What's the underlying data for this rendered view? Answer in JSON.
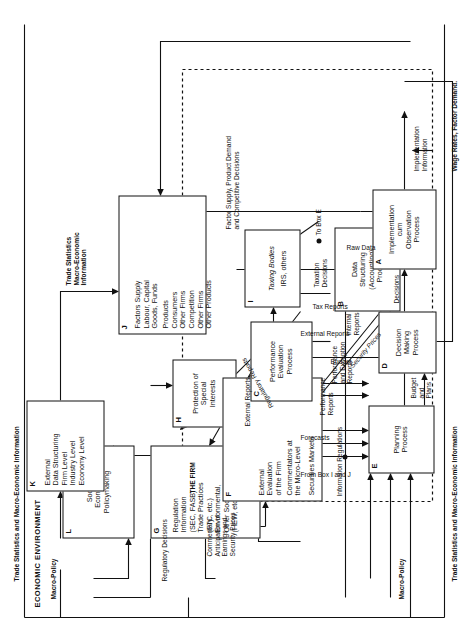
{
  "figure": {
    "title": "ECONOMIC ENVIRONMENT",
    "inner_region_label": "THE FIRM"
  },
  "boxes": [
    {
      "id": "A",
      "tag": "A",
      "text": "Implementation\ncum\nObservation\nProcess"
    },
    {
      "id": "B",
      "tag": "B",
      "text": "Data\nStructuring\n(Accounting)\nProcess"
    },
    {
      "id": "C",
      "tag": "C",
      "text": "Performance\nEvaluation\nProcess"
    },
    {
      "id": "D",
      "tag": "D",
      "text": "Decision\nMaking\nProcess"
    },
    {
      "id": "E",
      "tag": "E",
      "text": "Planning\nProcess"
    },
    {
      "id": "F",
      "tag": "F",
      "text": "External\nEvaluation\nof the Firm",
      "text2": "Commentators at\nthe Micro-Level",
      "text3": "Securities Markets"
    },
    {
      "id": "G",
      "tag": "G",
      "text": "Regulation\nInformation\n(SEC, FASB)\nTrade Practices\n(FTC, etc.)\nEnvironmental,\nOther Social\n(HEW, etc.)"
    },
    {
      "id": "H",
      "tag": "H",
      "text": "Protection of\nSpecial\nInterests"
    },
    {
      "id": "I",
      "tag": "I",
      "text_italic": "Taxing Bodies",
      "text": "IRS, others"
    },
    {
      "id": "J",
      "tag": "J",
      "group1_title": "Factors Supply",
      "group1": "Labour, Capital\nGoods, Funds",
      "group2_title": "Products",
      "group2": "Consumers\nOther Firms",
      "group3_title": "Competition",
      "group3": "Other Firms\nOther Products"
    },
    {
      "id": "K",
      "tag": "K",
      "text": "External\nData Structuring\nFirm Level\nIndustry Level\nEconomy Level"
    },
    {
      "id": "L",
      "tag": "L",
      "text": "Socio-\nEconomic\nPolicymaking"
    }
  ],
  "flow_labels": {
    "trade_stats_top": "Trade Statistics and Macro-Economic Information",
    "trade_stats_bottom": "Trade Statistics and Macro-Economic Information",
    "trade_stats_k_to_j": "Trade Statistics\nMacro-Economic\nInformation",
    "macro_policy_1": "Macro-Policy",
    "macro_policy_2": "Macro-Policy",
    "regulatory_decisions": "Regulatory Decisions",
    "regulatory_reports": "Regulatory Reports",
    "commentary": "Commentary\nAnticipation of\nEarnings and\nSecurity Prices",
    "information_regulations": "Information Regulations",
    "security_prices": "Security Prices",
    "external_reports_main": "External Reports",
    "external_reports_inner": "External Reports",
    "internal_reports": "Internal\nReports",
    "tax_reports": "Tax Reports",
    "taxation_decisions": "Taxation\nDecisions",
    "to_box_e": "To Box E",
    "factor_supply_demand": "Factor Supply, Product Demand\nand Competitive Decisions",
    "from_box_i_and_j": "From Box I and J",
    "forecasts": "Forecasts",
    "performance_reports": "Performance\nReports",
    "performance_exception_reports": "Performance\nand Exception\nReports",
    "budget": "Budget",
    "budget_and_plans": "Budget\nand\nPlans",
    "decisions": "Decisions",
    "raw_data": "Raw Data",
    "implementation_information": "Implementation\nInformation",
    "wage_rates": "Wage Rates, Factor Demand."
  },
  "colors": {
    "ink": "#111111",
    "paper": "#ffffff"
  }
}
